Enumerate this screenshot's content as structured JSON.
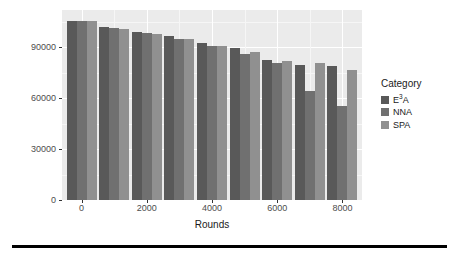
{
  "chart_data": {
    "type": "bar",
    "title": "",
    "subtitle": "",
    "xlabel": "Rounds",
    "ylabel": "Remaining_energy",
    "categories": [
      0,
      1000,
      2000,
      3000,
      4000,
      5000,
      6000,
      7000,
      8000
    ],
    "x_tick_labels": [
      "0",
      "2000",
      "4000",
      "6000",
      "8000"
    ],
    "x_tick_values": [
      0,
      2000,
      4000,
      6000,
      8000
    ],
    "y_tick_labels": [
      "0",
      "30000",
      "60000",
      "90000"
    ],
    "y_tick_values": [
      0,
      30000,
      60000,
      90000
    ],
    "xlim": [
      -600,
      8600
    ],
    "ylim": [
      0,
      112000
    ],
    "grid": true,
    "legend_position": "right",
    "legend_title": "Category",
    "series": [
      {
        "name": "E3A",
        "label_html": "E<sup>3</sup>A",
        "color": "#595959",
        "values": [
          105500,
          102000,
          99000,
          96500,
          92500,
          89500,
          82500,
          79500,
          79000
        ]
      },
      {
        "name": "NNA",
        "label_html": "NNA",
        "color": "#707070",
        "values": [
          105500,
          101500,
          98500,
          95000,
          90500,
          86000,
          80500,
          64500,
          55500
        ]
      },
      {
        "name": "SPA",
        "label_html": "SPA",
        "color": "#909090",
        "values": [
          105500,
          101000,
          98000,
          95000,
          90500,
          87500,
          82000,
          80500,
          76500
        ]
      }
    ]
  },
  "legend": {
    "title": "Category",
    "items": [
      {
        "label_html": "E<sup>3</sup>A",
        "color": "#595959"
      },
      {
        "label_html": "NNA",
        "color": "#707070"
      },
      {
        "label_html": "SPA",
        "color": "#909090"
      }
    ]
  },
  "panel": {
    "background": "#ebebeb",
    "gridline_color": "#ffffff"
  }
}
